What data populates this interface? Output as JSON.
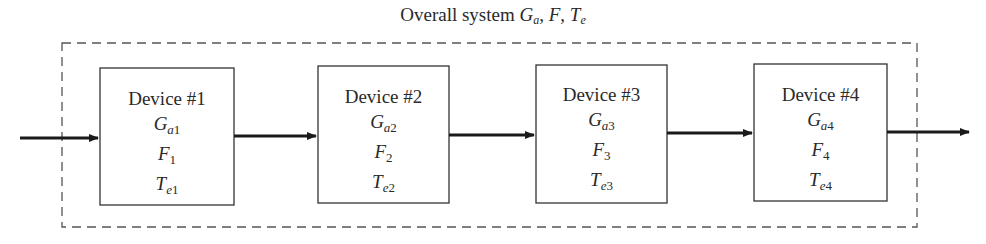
{
  "title": {
    "prefix": "Overall system ",
    "gain_symbol": "G",
    "gain_sub": "a",
    "sep1": ", ",
    "noise_figure": "F",
    "sep2": ", ",
    "temp_symbol": "T",
    "temp_sub": "e"
  },
  "devices": [
    {
      "name": "Device #1",
      "gain": "G",
      "gain_sub_letter": "a",
      "index": "1",
      "noise": "F",
      "temp": "T",
      "temp_sub_letter": "e"
    },
    {
      "name": "Device #2",
      "gain": "G",
      "gain_sub_letter": "a",
      "index": "2",
      "noise": "F",
      "temp": "T",
      "temp_sub_letter": "e"
    },
    {
      "name": "Device #3",
      "gain": "G",
      "gain_sub_letter": "a",
      "index": "3",
      "noise": "F",
      "temp": "T",
      "temp_sub_letter": "e"
    },
    {
      "name": "Device #4",
      "gain": "G",
      "gain_sub_letter": "a",
      "index": "4",
      "noise": "F",
      "temp": "T",
      "temp_sub_letter": "e"
    }
  ],
  "colors": {
    "line": "#2a2a2a",
    "dashed_border": "#555555",
    "background": "#ffffff"
  }
}
